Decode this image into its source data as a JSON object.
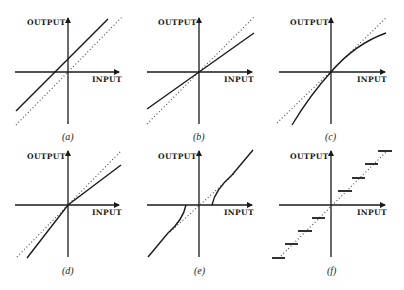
{
  "figure": {
    "y_axis_label": "OUTPUT",
    "x_axis_label": "INPUT",
    "panels": [
      {
        "id": "a",
        "caption": "(a)",
        "description": "Linear response with positive offset (parallel to identity line)"
      },
      {
        "id": "b",
        "caption": "(b)",
        "description": "Linear response through origin with slope less than 1"
      },
      {
        "id": "c",
        "caption": "(c)",
        "description": "Nonlinear (compressive) response through origin"
      },
      {
        "id": "d",
        "caption": "(d)",
        "description": "Piecewise linear: slope < 1 for positive input, slope > 1 for negative input"
      },
      {
        "id": "e",
        "caption": "(e)",
        "description": "Dead zone / threshold response around origin"
      },
      {
        "id": "f",
        "caption": "(f)",
        "description": "Quantized staircase response"
      }
    ],
    "reference_line": "dotted identity line (output = input)",
    "colors": {
      "ink": "#1a1a1a",
      "background": "#ffffff"
    }
  }
}
